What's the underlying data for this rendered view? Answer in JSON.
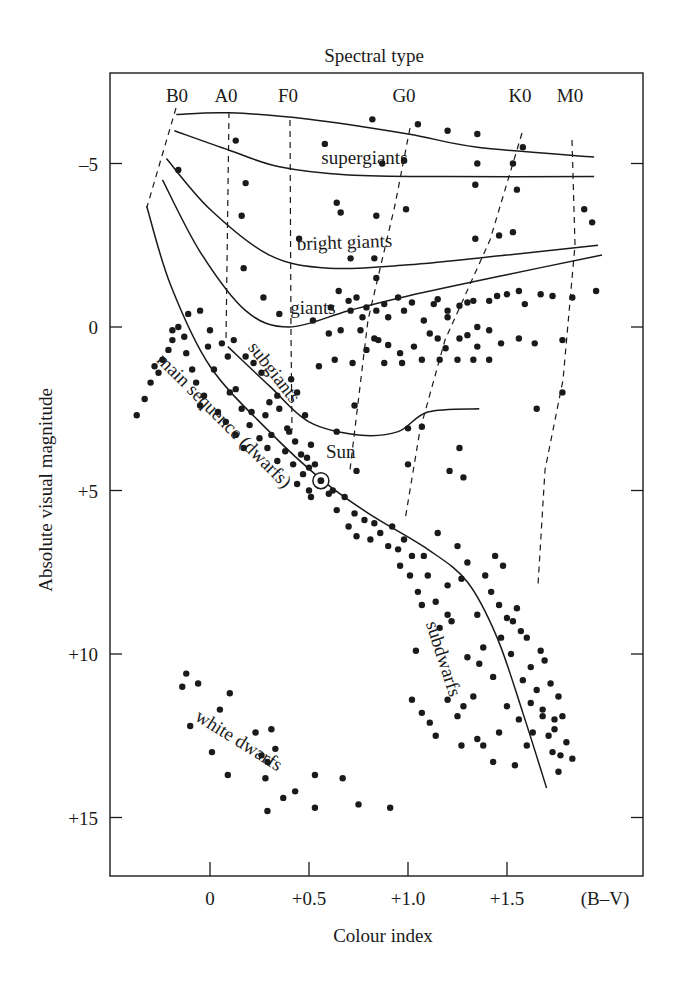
{
  "chart_data": {
    "type": "scatter",
    "title": "Spectral type",
    "xlabel": "Colour index",
    "ylabel": "Absolute visual magnitude",
    "x_unit_label": "(B–V)",
    "xlim": [
      -0.5,
      2.14
    ],
    "ylim": [
      -7.5,
      16.9
    ],
    "y_inverted": true,
    "grid": false,
    "legend": null,
    "x_ticks": [
      {
        "value": 0,
        "label": "0"
      },
      {
        "value": 0.5,
        "label": "+0.5"
      },
      {
        "value": 1.0,
        "label": "+1.0"
      },
      {
        "value": 1.5,
        "label": "+1.5"
      }
    ],
    "y_ticks": [
      {
        "value": -5,
        "label": "–5"
      },
      {
        "value": 0,
        "label": "0"
      },
      {
        "value": 5,
        "label": "+5"
      },
      {
        "value": 10,
        "label": "+10"
      },
      {
        "value": 15,
        "label": "+15"
      }
    ],
    "spectral_types": [
      {
        "label": "B0",
        "x": -0.21
      },
      {
        "label": "A0",
        "x": 0.02
      },
      {
        "label": "F0",
        "x": 0.33
      },
      {
        "label": "G0",
        "x": 0.83
      },
      {
        "label": "K0",
        "x": 1.36
      },
      {
        "label": "M0",
        "x": 1.6
      }
    ],
    "luminosity_classes": [
      {
        "name": "supergiants (upper)",
        "points": [
          [
            -0.17,
            -6.5
          ],
          [
            0.1,
            -6.55
          ],
          [
            0.5,
            -6.35
          ],
          [
            1.0,
            -5.9
          ],
          [
            1.35,
            -5.5
          ],
          [
            1.94,
            -5.2
          ]
        ]
      },
      {
        "name": "supergiants (lower)",
        "points": [
          [
            -0.18,
            -6.0
          ],
          [
            0.1,
            -5.4
          ],
          [
            0.35,
            -4.9
          ],
          [
            0.7,
            -4.65
          ],
          [
            1.2,
            -4.6
          ],
          [
            1.94,
            -4.6
          ]
        ]
      },
      {
        "name": "bright giants",
        "points": [
          [
            -0.22,
            -5.15
          ],
          [
            0.0,
            -3.6
          ],
          [
            0.3,
            -2.2
          ],
          [
            0.6,
            -1.8
          ],
          [
            1.0,
            -1.9
          ],
          [
            1.5,
            -2.2
          ],
          [
            1.96,
            -2.5
          ]
        ]
      },
      {
        "name": "giants",
        "points": [
          [
            -0.24,
            -4.5
          ],
          [
            -0.05,
            -2.3
          ],
          [
            0.18,
            -0.5
          ],
          [
            0.4,
            0.0
          ],
          [
            0.7,
            -0.5
          ],
          [
            1.0,
            -0.95
          ],
          [
            1.5,
            -1.6
          ],
          [
            1.98,
            -2.2
          ]
        ]
      },
      {
        "name": "subgiants",
        "points": [
          [
            0.09,
            0.6
          ],
          [
            0.3,
            1.8
          ],
          [
            0.5,
            2.9
          ],
          [
            0.75,
            3.3
          ],
          [
            0.95,
            3.2
          ],
          [
            1.1,
            2.6
          ],
          [
            1.36,
            2.5
          ]
        ]
      },
      {
        "name": "main sequence (dwarfs)",
        "points": [
          [
            -0.32,
            -3.7
          ],
          [
            -0.2,
            -1.3
          ],
          [
            0.0,
            1.2
          ],
          [
            0.3,
            3.2
          ],
          [
            0.56,
            4.65
          ],
          [
            0.8,
            5.7
          ],
          [
            1.1,
            6.8
          ],
          [
            1.3,
            7.8
          ],
          [
            1.45,
            9.5
          ],
          [
            1.58,
            11.8
          ],
          [
            1.7,
            14.1
          ]
        ]
      }
    ],
    "region_labels": [
      {
        "text": "supergiants",
        "x": 0.78,
        "y": -5.0,
        "rotate": 0
      },
      {
        "text": "bright giants",
        "x": 0.68,
        "y": -2.4,
        "rotate": -2
      },
      {
        "text": "giants",
        "x": 0.52,
        "y": -0.4,
        "rotate": 0
      },
      {
        "text": "subgiants",
        "x": 0.3,
        "y": 1.5,
        "rotate": 52
      },
      {
        "text": "main sequence (dwarfs)",
        "x": 0.05,
        "y": 3.0,
        "rotate": 45
      },
      {
        "text": "Sun",
        "x": 0.66,
        "y": 4.0,
        "rotate": 0
      },
      {
        "text": "subdwarfs",
        "x": 1.15,
        "y": 10.2,
        "rotate": 72
      },
      {
        "text": "white dwarfs",
        "x": 0.13,
        "y": 12.8,
        "rotate": 32
      }
    ],
    "sun": {
      "x": 0.56,
      "y": 4.7
    },
    "stars": [
      [
        0.13,
        -5.7
      ],
      [
        0.58,
        -5.6
      ],
      [
        0.82,
        -6.35
      ],
      [
        1.05,
        -6.2
      ],
      [
        1.2,
        -6.0
      ],
      [
        1.35,
        -5.9
      ],
      [
        1.58,
        -5.5
      ],
      [
        0.87,
        -5.0
      ],
      [
        0.98,
        -5.1
      ],
      [
        1.35,
        -5.0
      ],
      [
        1.53,
        -5.0
      ],
      [
        -0.16,
        -4.8
      ],
      [
        0.18,
        -4.4
      ],
      [
        0.16,
        -3.4
      ],
      [
        0.64,
        -3.8
      ],
      [
        0.84,
        -3.4
      ],
      [
        0.99,
        -3.6
      ],
      [
        1.34,
        -4.35
      ],
      [
        1.55,
        -4.2
      ],
      [
        0.17,
        -1.8
      ],
      [
        0.66,
        -3.5
      ],
      [
        0.45,
        -2.7
      ],
      [
        0.71,
        -2.1
      ],
      [
        0.83,
        -2.1
      ],
      [
        1.34,
        -2.7
      ],
      [
        1.46,
        -2.8
      ],
      [
        1.53,
        -2.9
      ],
      [
        1.89,
        -3.6
      ],
      [
        1.93,
        -3.2
      ],
      [
        0.27,
        -0.9
      ],
      [
        0.61,
        -0.6
      ],
      [
        0.84,
        -1.5
      ],
      [
        -0.37,
        2.7
      ],
      [
        -0.33,
        2.2
      ],
      [
        -0.3,
        1.7
      ],
      [
        -0.26,
        1.4
      ],
      [
        -0.24,
        1.0
      ],
      [
        -0.21,
        0.7
      ],
      [
        -0.19,
        0.4
      ],
      [
        -0.16,
        0.0
      ],
      [
        -0.13,
        0.3
      ],
      [
        -0.12,
        0.8
      ],
      [
        -0.09,
        1.3
      ],
      [
        -0.07,
        1.7
      ],
      [
        -0.03,
        2.1
      ],
      [
        0.02,
        1.3
      ],
      [
        -0.05,
        2.4
      ],
      [
        0.04,
        2.6
      ],
      [
        0.08,
        2.9
      ],
      [
        0.13,
        3.3
      ],
      [
        0.17,
        3.7
      ],
      [
        0.1,
        2.0
      ],
      [
        0.16,
        2.5
      ],
      [
        0.2,
        3.0
      ],
      [
        0.25,
        3.4
      ],
      [
        0.29,
        3.7
      ],
      [
        0.34,
        4.1
      ],
      [
        -0.01,
        0.6
      ],
      [
        0.06,
        0.5
      ],
      [
        0.12,
        0.4
      ],
      [
        0.18,
        0.9
      ],
      [
        0.22,
        1.1
      ],
      [
        0.26,
        1.4
      ],
      [
        0.3,
        2.3
      ],
      [
        0.35,
        2.5
      ],
      [
        0.39,
        3.1
      ],
      [
        0.43,
        3.5
      ],
      [
        0.46,
        3.9
      ],
      [
        0.5,
        4.3
      ],
      [
        -0.28,
        1.2
      ],
      [
        -0.19,
        0.1
      ],
      [
        -0.11,
        -0.4
      ],
      [
        -0.05,
        -0.5
      ],
      [
        0.0,
        0.1
      ],
      [
        0.09,
        0.9
      ],
      [
        0.13,
        1.9
      ],
      [
        0.21,
        2.6
      ],
      [
        0.31,
        3.3
      ],
      [
        0.38,
        3.8
      ],
      [
        0.42,
        4.2
      ],
      [
        0.47,
        4.5
      ],
      [
        0.28,
        2.7
      ],
      [
        0.34,
        2.1
      ],
      [
        0.41,
        1.6
      ],
      [
        0.44,
        2.0
      ],
      [
        0.4,
        3.2
      ],
      [
        0.49,
        4.0
      ],
      [
        0.53,
        4.2
      ],
      [
        0.51,
        3.6
      ],
      [
        0.48,
        2.7
      ],
      [
        0.35,
        -0.4
      ],
      [
        0.52,
        -0.2
      ],
      [
        0.55,
        1.2
      ],
      [
        0.6,
        0.2
      ],
      [
        0.66,
        0.1
      ],
      [
        0.71,
        -0.5
      ],
      [
        0.74,
        -0.9
      ],
      [
        0.79,
        -0.6
      ],
      [
        0.76,
        0.1
      ],
      [
        0.84,
        -0.5
      ],
      [
        0.88,
        -0.7
      ],
      [
        0.9,
        -0.3
      ],
      [
        0.95,
        -0.9
      ],
      [
        0.98,
        -0.5
      ],
      [
        1.02,
        -0.75
      ],
      [
        1.08,
        -0.2
      ],
      [
        1.13,
        -0.7
      ],
      [
        1.15,
        -0.85
      ],
      [
        1.2,
        -0.5
      ],
      [
        1.26,
        -0.65
      ],
      [
        1.3,
        -0.75
      ],
      [
        1.33,
        -0.8
      ],
      [
        1.41,
        -0.8
      ],
      [
        1.45,
        -0.95
      ],
      [
        1.5,
        -1.0
      ],
      [
        1.56,
        -1.1
      ],
      [
        1.59,
        -0.7
      ],
      [
        1.67,
        -1.0
      ],
      [
        1.73,
        -0.95
      ],
      [
        1.83,
        -0.9
      ],
      [
        1.95,
        -1.1
      ],
      [
        0.65,
        -1.1
      ],
      [
        0.7,
        -0.8
      ],
      [
        0.77,
        -0.3
      ],
      [
        0.83,
        0.35
      ],
      [
        0.9,
        0.55
      ],
      [
        0.96,
        0.8
      ],
      [
        1.03,
        0.6
      ],
      [
        1.11,
        0.2
      ],
      [
        1.15,
        0.35
      ],
      [
        1.2,
        -0.3
      ],
      [
        1.26,
        0.35
      ],
      [
        1.35,
        0.0
      ],
      [
        1.41,
        0.1
      ],
      [
        1.47,
        0.5
      ],
      [
        1.56,
        0.35
      ],
      [
        1.19,
        0.65
      ],
      [
        1.3,
        0.25
      ],
      [
        1.35,
        0.6
      ],
      [
        1.64,
        0.5
      ],
      [
        1.78,
        0.4
      ],
      [
        0.63,
        1.0
      ],
      [
        0.72,
        1.1
      ],
      [
        0.79,
        0.7
      ],
      [
        0.85,
        0.4
      ],
      [
        0.88,
        1.1
      ],
      [
        0.97,
        1.1
      ],
      [
        1.07,
        1.0
      ],
      [
        1.16,
        1.0
      ],
      [
        1.25,
        1.0
      ],
      [
        1.33,
        1.0
      ],
      [
        1.41,
        1.0
      ],
      [
        0.73,
        2.4
      ],
      [
        0.64,
        3.2
      ],
      [
        1.0,
        3.1
      ],
      [
        1.07,
        3.05
      ],
      [
        1.26,
        3.7
      ],
      [
        1.65,
        2.5
      ],
      [
        1.78,
        2.0
      ],
      [
        0.74,
        4.4
      ],
      [
        0.6,
        5.1
      ],
      [
        0.51,
        5.2
      ],
      [
        1.21,
        4.4
      ],
      [
        1.0,
        4.2
      ],
      [
        1.28,
        4.6
      ],
      [
        0.44,
        4.8
      ],
      [
        0.5,
        5.0
      ],
      [
        0.62,
        5.0
      ],
      [
        0.68,
        5.2
      ],
      [
        0.73,
        5.7
      ],
      [
        0.78,
        5.9
      ],
      [
        0.83,
        6.0
      ],
      [
        0.74,
        6.4
      ],
      [
        0.81,
        6.5
      ],
      [
        0.86,
        6.3
      ],
      [
        0.9,
        6.7
      ],
      [
        0.95,
        6.8
      ],
      [
        0.98,
        6.5
      ],
      [
        1.02,
        7.0
      ],
      [
        1.08,
        7.0
      ],
      [
        1.15,
        6.3
      ],
      [
        1.25,
        6.7
      ],
      [
        1.3,
        7.2
      ],
      [
        1.27,
        7.7
      ],
      [
        1.2,
        7.9
      ],
      [
        1.1,
        7.6
      ],
      [
        1.05,
        8.1
      ],
      [
        1.14,
        8.4
      ],
      [
        1.2,
        8.8
      ],
      [
        0.64,
        5.6
      ],
      [
        0.7,
        6.1
      ],
      [
        0.92,
        6.1
      ],
      [
        0.96,
        7.3
      ],
      [
        1.01,
        7.6
      ],
      [
        1.07,
        8.5
      ],
      [
        1.16,
        9.2
      ],
      [
        1.22,
        9.0
      ],
      [
        1.35,
        8.8
      ],
      [
        1.42,
        8.1
      ],
      [
        1.46,
        8.5
      ],
      [
        1.5,
        8.9
      ],
      [
        1.55,
        8.6
      ],
      [
        1.57,
        9.3
      ],
      [
        1.6,
        9.5
      ],
      [
        1.44,
        7.0
      ],
      [
        1.48,
        7.3
      ],
      [
        1.39,
        7.6
      ],
      [
        1.53,
        9.0
      ],
      [
        1.52,
        10.0
      ],
      [
        1.62,
        10.4
      ],
      [
        1.58,
        10.8
      ],
      [
        1.65,
        11.1
      ],
      [
        1.68,
        11.9
      ],
      [
        1.38,
        9.8
      ],
      [
        1.36,
        10.3
      ],
      [
        1.3,
        10.1
      ],
      [
        1.28,
        11.6
      ],
      [
        1.33,
        11.3
      ],
      [
        1.47,
        9.5
      ],
      [
        1.43,
        10.7
      ],
      [
        1.5,
        11.6
      ],
      [
        1.56,
        12.0
      ],
      [
        1.6,
        12.8
      ],
      [
        1.63,
        12.4
      ],
      [
        1.71,
        12.5
      ],
      [
        1.73,
        13.0
      ],
      [
        1.76,
        13.6
      ],
      [
        1.74,
        12.0
      ],
      [
        1.76,
        11.3
      ],
      [
        1.8,
        12.7
      ],
      [
        1.83,
        13.2
      ],
      [
        1.72,
        10.9
      ],
      [
        1.78,
        11.9
      ],
      [
        1.69,
        10.2
      ],
      [
        1.67,
        9.9
      ],
      [
        1.2,
        11.4
      ],
      [
        1.25,
        11.9
      ],
      [
        1.38,
        12.8
      ],
      [
        1.43,
        13.3
      ],
      [
        1.46,
        12.4
      ],
      [
        1.54,
        13.4
      ],
      [
        1.62,
        11.5
      ],
      [
        1.68,
        11.7
      ],
      [
        1.74,
        12.3
      ],
      [
        1.77,
        13.1
      ],
      [
        1.11,
        12.1
      ],
      [
        1.07,
        11.8
      ],
      [
        1.02,
        11.4
      ],
      [
        1.14,
        12.5
      ],
      [
        1.35,
        12.6
      ],
      [
        1.27,
        12.8
      ],
      [
        1.04,
        9.9
      ],
      [
        -0.12,
        10.6
      ],
      [
        -0.06,
        10.9
      ],
      [
        -0.14,
        11.0
      ],
      [
        0.1,
        11.2
      ],
      [
        -0.1,
        12.2
      ],
      [
        0.05,
        11.7
      ],
      [
        0.23,
        12.4
      ],
      [
        0.31,
        12.3
      ],
      [
        0.01,
        13.0
      ],
      [
        0.26,
        13.1
      ],
      [
        0.33,
        12.9
      ],
      [
        0.29,
        13.3
      ],
      [
        0.09,
        13.7
      ],
      [
        0.28,
        13.8
      ],
      [
        0.53,
        13.7
      ],
      [
        0.67,
        13.8
      ],
      [
        0.75,
        14.6
      ],
      [
        0.91,
        14.7
      ],
      [
        0.29,
        14.8
      ],
      [
        0.53,
        14.7
      ],
      [
        0.43,
        14.2
      ],
      [
        0.37,
        14.4
      ]
    ],
    "colors": {
      "ink": "#1a1a1a",
      "background": "#ffffff"
    }
  },
  "labels": {
    "title": "Spectral type",
    "xlabel": "Colour index",
    "ylabel": "Absolute visual magnitude",
    "x_unit": "(B–V)"
  }
}
